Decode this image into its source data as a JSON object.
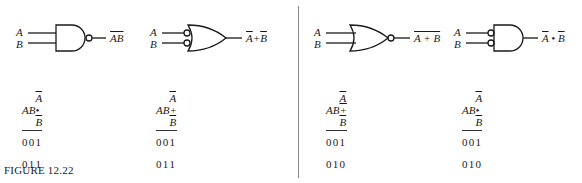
{
  "figure": {
    "caption": "FIGURE 12.22"
  },
  "gates": [
    {
      "id": "nand",
      "shape": "and-with-output-bubble",
      "inputs": [
        "A",
        "B"
      ],
      "output_label": "AB",
      "output_overline": true,
      "table": {
        "headers": [
          "A",
          "B",
          "A • B"
        ],
        "header3_overline": [
          "A",
          "B"
        ],
        "rows": [
          [
            "0",
            "0",
            "1"
          ],
          [
            "0",
            "1",
            "1"
          ],
          [
            "1",
            "0",
            "1"
          ],
          [
            "1",
            "1",
            "0"
          ]
        ]
      }
    },
    {
      "id": "or-inverted-inputs",
      "shape": "or-with-input-bubbles",
      "inputs": [
        "A",
        "B"
      ],
      "output_label": "A + B",
      "output_overline": "per-term",
      "table": {
        "headers": [
          "A",
          "B",
          "A + B"
        ],
        "header3_overline": [
          "A",
          "B"
        ],
        "rows": [
          [
            "0",
            "0",
            "1"
          ],
          [
            "0",
            "1",
            "1"
          ],
          [
            "1",
            "0",
            "1"
          ],
          [
            "1",
            "1",
            "0"
          ]
        ]
      }
    },
    {
      "id": "nor",
      "shape": "or-with-output-bubble",
      "inputs": [
        "A",
        "B"
      ],
      "output_label": "A + B",
      "output_overline": true,
      "table": {
        "headers": [
          "A",
          "B",
          "A + B"
        ],
        "header3_overline": "whole",
        "rows": [
          [
            "0",
            "0",
            "1"
          ],
          [
            "0",
            "1",
            "0"
          ],
          [
            "1",
            "0",
            "0"
          ],
          [
            "1",
            "1",
            "0"
          ]
        ]
      }
    },
    {
      "id": "and-inverted-inputs",
      "shape": "and-with-input-bubbles",
      "inputs": [
        "A",
        "B"
      ],
      "output_label": "A • B",
      "output_overline": "per-term",
      "table": {
        "headers": [
          "A",
          "B",
          "A • B"
        ],
        "header3_overline": [
          "A",
          "B"
        ],
        "rows": [
          [
            "0",
            "0",
            "1"
          ],
          [
            "0",
            "1",
            "0"
          ],
          [
            "1",
            "0",
            "0"
          ],
          [
            "1",
            "1",
            "0"
          ]
        ]
      }
    }
  ]
}
